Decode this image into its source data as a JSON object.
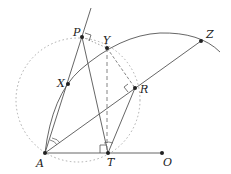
{
  "diagram": {
    "points": {
      "A": {
        "label": "A",
        "x": 45,
        "y": 153
      },
      "T": {
        "label": "T",
        "x": 108,
        "y": 153
      },
      "O": {
        "label": "O",
        "x": 162,
        "y": 153
      },
      "P": {
        "label": "P",
        "x": 82,
        "y": 37
      },
      "Y": {
        "label": "Y",
        "x": 107,
        "y": 48
      },
      "Z": {
        "label": "Z",
        "x": 201,
        "y": 41
      },
      "X": {
        "label": "X",
        "x": 68,
        "y": 84
      },
      "R": {
        "label": "R",
        "x": 135,
        "y": 88
      }
    },
    "colors": {
      "stroke": "#555555",
      "point": "#222222",
      "dotted": "#aaaaaa"
    }
  }
}
